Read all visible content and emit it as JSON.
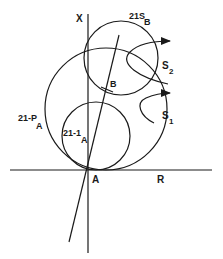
{
  "diagram": {
    "type": "geometry-figure",
    "colors": {
      "ink": "#1a1a1a",
      "background": "#ffffff"
    },
    "axes": {
      "vertical_label": "X",
      "horizontal_label": "R"
    },
    "points": {
      "origin_label": "A",
      "tangent_point_label": "B"
    },
    "circles": [
      {
        "id": "21-P",
        "label_main": "21-P",
        "label_sub": "A"
      },
      {
        "id": "21-1",
        "label_main": "21-1",
        "label_sub": "A"
      },
      {
        "id": "21S",
        "label_main": "21S",
        "label_sub": "B"
      }
    ],
    "arrows": [
      {
        "id": "S2",
        "label_main": "S",
        "label_sub": "2"
      },
      {
        "id": "S1",
        "label_main": "S",
        "label_sub": "1"
      }
    ]
  }
}
